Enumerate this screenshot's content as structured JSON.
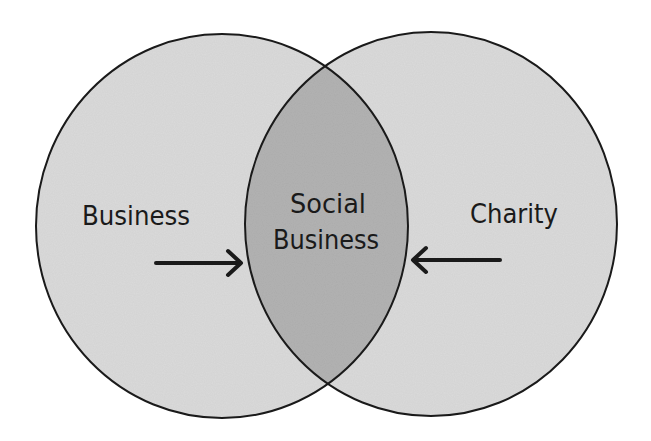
{
  "diagram": {
    "type": "venn",
    "sets": [
      {
        "label": "Business",
        "fill": "#dcdcdc"
      },
      {
        "label": "Charity",
        "fill": "#dcdcdc"
      }
    ],
    "intersection": {
      "label_line1": "Social",
      "label_line2": "Business",
      "fill": "#b4b4b4"
    },
    "arrows": [
      {
        "from": "Business",
        "to": "Social Business",
        "direction": "right"
      },
      {
        "from": "Charity",
        "to": "Social Business",
        "direction": "left"
      }
    ],
    "colors": {
      "stroke": "#1a1a1a",
      "background": "#ffffff"
    }
  }
}
